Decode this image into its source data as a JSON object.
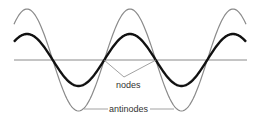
{
  "diagram": {
    "labels": {
      "nodes": "nodes",
      "antinodes": "antinodes"
    },
    "colors": {
      "axis": "#8a8a8a",
      "envelope_wave": "#8a8a8a",
      "instant_wave": "#111111",
      "label": "#333333",
      "background": "#ffffff"
    },
    "geometry": {
      "axis_y": 60,
      "x_start": 14,
      "x_end": 246,
      "half_wavelength": 51.5,
      "first_peak_x": 27,
      "envelope_amplitude": 51,
      "instant_amplitude": 26,
      "node_x": [
        53,
        104.5,
        156,
        207.5
      ]
    }
  }
}
